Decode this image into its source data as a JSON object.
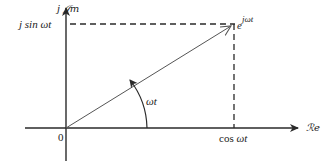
{
  "diagram": {
    "colors": {
      "axis": "#2a2a2a",
      "phasor": "#555555",
      "dashed": "#2a2a2a",
      "text": "#222222"
    },
    "labels": {
      "imag_axis_prefix": "j",
      "imag_axis_symbol": "𝒥m",
      "real_axis_symbol": "ℛe",
      "origin": "0",
      "sin_projection_prefix": "j sin",
      "sin_projection_arg": "ωt",
      "cos_projection_prefix": "cos",
      "cos_projection_arg": "ωt",
      "phasor_base": "e",
      "phasor_exponent": "jωt",
      "angle": "ωt"
    }
  }
}
